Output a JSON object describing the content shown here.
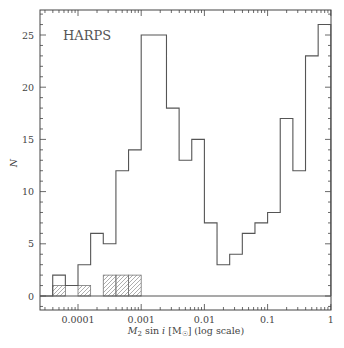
{
  "chart_data": {
    "type": "bar",
    "subtype": "step-histogram",
    "title": "",
    "annotation": "HARPS",
    "xlabel": "M2 sin i [M☉] (log scale)",
    "xlabel_parts": {
      "m": "M",
      "sub": "2",
      "rest": " sin ",
      "i": "i",
      "unit": " [M",
      "unit_sub": "☉",
      "tail": "] (log scale)"
    },
    "ylabel": "N",
    "xscale": "log",
    "xlim": [
      2.5e-05,
      1.05
    ],
    "ylim": [
      -1.5,
      27.3
    ],
    "xticks": [
      0.0001,
      0.001,
      0.01,
      0.1,
      1
    ],
    "xtick_labels": [
      "0.0001",
      "0.001",
      "0.01",
      "0.1",
      "1"
    ],
    "yticks": [
      0,
      5,
      10,
      15,
      20,
      25
    ],
    "ytick_labels": [
      "0",
      "5",
      "10",
      "15",
      "20",
      "25"
    ],
    "grid": false,
    "legend": null,
    "bin_width_dex": 0.2,
    "bin_edges_log10": [
      -4.4,
      -4.2,
      -4.0,
      -3.8,
      -3.6,
      -3.4,
      -3.2,
      -3.0,
      -2.8,
      -2.6,
      -2.4,
      -2.2,
      -2.0,
      -1.8,
      -1.6,
      -1.4,
      -1.2,
      -1.0,
      -0.8,
      -0.6,
      -0.4,
      -0.2,
      0.0
    ],
    "series": [
      {
        "name": "All companions",
        "style": "outline",
        "values": [
          2,
          1,
          3,
          6,
          5,
          12,
          14,
          25,
          25,
          18,
          13,
          15,
          7,
          3,
          4,
          6,
          7,
          8,
          17,
          12,
          23,
          26
        ]
      },
      {
        "name": "Hatched subset",
        "style": "hatched",
        "values": [
          1,
          0,
          1,
          0,
          2,
          2,
          2,
          0,
          0,
          0,
          0,
          0,
          0,
          0,
          0,
          0,
          0,
          0,
          0,
          0,
          0,
          0
        ]
      }
    ]
  }
}
